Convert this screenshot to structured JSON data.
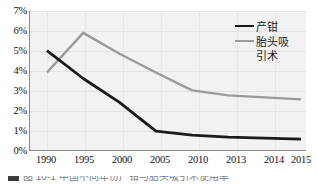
{
  "chart_data": {
    "type": "line",
    "title": "",
    "subtitle": "",
    "xlabel": "",
    "ylabel": "",
    "categories": [
      "1990",
      "1995",
      "2000",
      "2005",
      "2010",
      "2013",
      "2014",
      "2015"
    ],
    "series": [
      {
        "name": "产钳",
        "color": "#1a1a1a",
        "values": [
          5.0,
          3.6,
          2.4,
          0.95,
          0.75,
          0.65,
          0.6,
          0.55
        ]
      },
      {
        "name": "胎头吸引术",
        "color": "#9a9a9a",
        "values": [
          3.9,
          5.9,
          4.85,
          3.9,
          3.0,
          2.75,
          2.65,
          2.55
        ]
      }
    ],
    "ylim": [
      0,
      7
    ],
    "ytick_values": [
      0,
      1,
      2,
      3,
      4,
      5,
      6,
      7
    ],
    "ytick_labels": [
      "0%",
      "1%",
      "2%",
      "3%",
      "4%",
      "5%",
      "6%",
      "7%"
    ],
    "xtick_labels": [
      "1990",
      "1995",
      "2000",
      "2005",
      "2010",
      "2013",
      "2014",
      "2015"
    ],
    "grid": "horizontal-and-vertical",
    "legend_position": "top-right-inside",
    "plot_background": "#f2f2f2",
    "gridline_color": "#e2e2e2",
    "axis_color": "#8a8a8a"
  },
  "legend": {
    "entries": [
      {
        "label": "产钳",
        "label_line2": "",
        "color": "#1a1a1a"
      },
      {
        "label": "胎头吸引",
        "label_line2": "引术",
        "color": "#9a9a9a"
      }
    ],
    "entry_1_label": "产钳",
    "entry_2_label_line1": "胎头吸",
    "entry_2_label_line2": "引术"
  },
  "caption": {
    "text": "图 10-1  中国不同年份产钳与胎头吸引术使用率"
  }
}
